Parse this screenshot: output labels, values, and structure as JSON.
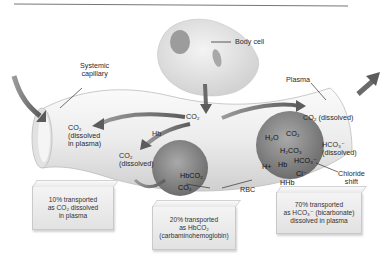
{
  "diagram": {
    "labels": {
      "body_cell": "Body cell",
      "systemic_capillary_line1": "Systemic",
      "systemic_capillary_line2": "capillary",
      "plasma": "Plasma",
      "co2_source": "CO₂",
      "co2_dissolved_plasma_line1": "CO₂",
      "co2_dissolved_plasma_line2": "(dissolved",
      "co2_dissolved_plasma_line3": "in plasma)",
      "hb": "Hb",
      "co2_dissolved_left_line1": "CO₂",
      "co2_dissolved_left_line2": "(dissolved)",
      "hbco2": "HbCO₂",
      "co2_rbc": "CO₂",
      "rbc": "RBC",
      "co2_dissolved_right": "CO₂ (dissolved)",
      "h2o": "H₂O",
      "co2_inner": "CO₂",
      "h2co3": "H₂CO₃",
      "hco3_inner": "HCO₃⁻",
      "h_plus": "H+",
      "hb_inner": "Hb",
      "cl_minus": "Cl⁻",
      "hhb": "HHb",
      "hco3_dissolved_line1": "HCO₃⁻",
      "hco3_dissolved_line2": "(dissolved)",
      "chloride_shift_line1": "Chloride",
      "chloride_shift_line2": "shift"
    },
    "boxes": [
      {
        "line1": "10% transported",
        "line2": "as CO₂ dissolved",
        "line3": "in plasma"
      },
      {
        "line1": "20% transported",
        "line2": "as HbCO₂",
        "line3": "(carbaminohemoglobin)"
      },
      {
        "line1": "70% transported",
        "line2": "as HCO₃⁻ (bicarbonate)",
        "line3": "dissolved in plasma"
      }
    ],
    "percentages": {
      "dissolved_co2": 10,
      "carbaminohemoglobin": 20,
      "bicarbonate": 70
    }
  }
}
